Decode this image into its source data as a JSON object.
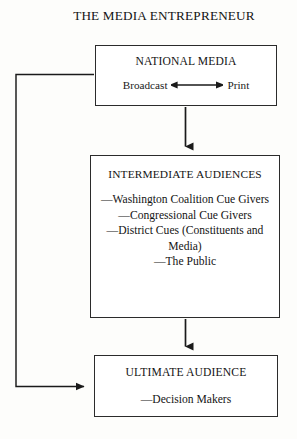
{
  "diagram": {
    "title": "THE MEDIA ENTREPRENEUR",
    "boxes": {
      "national_media": {
        "title": "NATIONAL MEDIA",
        "left_label": "Broadcast",
        "right_label": "Print",
        "relation_icon": "double-headed-arrow"
      },
      "intermediate_audiences": {
        "title": "INTERMEDIATE AUDIENCES",
        "items": [
          "—Washington Coalition Cue Givers",
          "—Congressional Cue Givers",
          "—District Cues (Constituents and Media)",
          "—The Public"
        ]
      },
      "ultimate_audience": {
        "title": "ULTIMATE AUDIENCE",
        "items": [
          "—Decision Makers"
        ]
      }
    },
    "connectors": [
      {
        "name": "national-to-intermediate",
        "icon": "arrow-down-icon",
        "from": "national_media",
        "to": "intermediate_audiences"
      },
      {
        "name": "intermediate-to-ultimate",
        "icon": "arrow-down-icon",
        "from": "intermediate_audiences",
        "to": "ultimate_audience"
      },
      {
        "name": "feedback-loop",
        "icon": "arrow-right-icon",
        "from": "national_media",
        "to": "ultimate_audience"
      }
    ],
    "colors": {
      "background": "#fdfdfb",
      "box_fill": "#ffffff",
      "stroke": "#2b2b2b",
      "text": "#141414"
    }
  }
}
